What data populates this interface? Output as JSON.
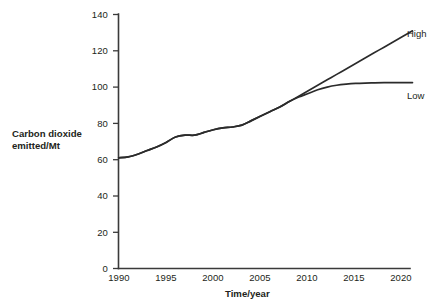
{
  "figure": {
    "background": "#ffffff",
    "line_color": "#2b2b2b",
    "axis_color": "#3a3a3a"
  },
  "axes": {
    "x_title": "Time/year",
    "y_title_line1": "Carbon dioxide",
    "y_title_line2": "emitted/Mt",
    "x_ticks": [
      "1990",
      "1995",
      "2000",
      "2005",
      "2010",
      "2015",
      "2020"
    ],
    "y_ticks": [
      "0",
      "20",
      "40",
      "60",
      "80",
      "100",
      "120",
      "140"
    ]
  },
  "series_labels": {
    "high": "High",
    "low": "Low"
  },
  "chart_data": {
    "type": "line",
    "title": "",
    "xlabel": "Time/year",
    "ylabel": "Carbon dioxide emitted/Mt",
    "xlim": [
      1990,
      2021
    ],
    "ylim": [
      0,
      140
    ],
    "xticks": [
      1990,
      1995,
      2000,
      2005,
      2010,
      2015,
      2020
    ],
    "yticks": [
      0,
      20,
      40,
      60,
      80,
      100,
      120,
      140
    ],
    "grid": false,
    "legend": "inline-right-labels",
    "annotations": [
      "High",
      "Low"
    ],
    "series": [
      {
        "name": "High",
        "x": [
          1990,
          1991,
          1992,
          1993,
          1994,
          1995,
          1996,
          1997,
          1998,
          1999,
          2000,
          2001,
          2002,
          2003,
          2004,
          2005,
          2006,
          2007,
          2008,
          2009,
          2010,
          2011,
          2012,
          2013,
          2014,
          2015,
          2016,
          2017,
          2018,
          2019,
          2020,
          2021
        ],
        "values": [
          61,
          61.5,
          63,
          65,
          67,
          69.5,
          72.5,
          73.5,
          73.5,
          75,
          76.5,
          77.5,
          78,
          79,
          81.5,
          84,
          86.5,
          89,
          92,
          95,
          98,
          101,
          104,
          107,
          110,
          113,
          116,
          119,
          122,
          125,
          128,
          131
        ]
      },
      {
        "name": "Low",
        "x": [
          1990,
          1991,
          1992,
          1993,
          1994,
          1995,
          1996,
          1997,
          1998,
          1999,
          2000,
          2001,
          2002,
          2003,
          2004,
          2005,
          2006,
          2007,
          2008,
          2009,
          2010,
          2011,
          2012,
          2013,
          2014,
          2015,
          2016,
          2017,
          2018,
          2019,
          2020,
          2021
        ],
        "values": [
          61,
          61.5,
          63,
          65,
          67,
          69.5,
          72.5,
          73.5,
          73.5,
          75,
          76.5,
          77.5,
          78,
          79,
          81.5,
          84,
          86.5,
          89,
          92,
          94.5,
          96.5,
          98.5,
          100,
          101,
          101.6,
          102,
          102.2,
          102.3,
          102.4,
          102.5,
          102.5,
          102.5
        ]
      }
    ]
  }
}
